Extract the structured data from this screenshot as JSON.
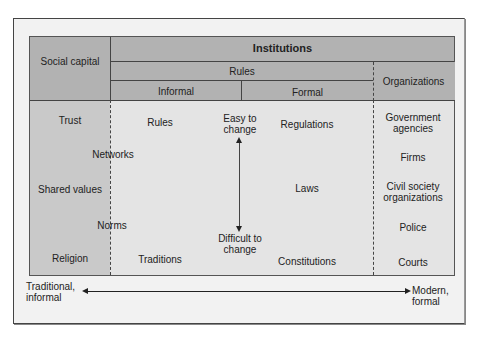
{
  "header": {
    "social_capital": "Social capital",
    "institutions": "Institutions",
    "rules": "Rules",
    "informal": "Informal",
    "formal": "Formal",
    "organizations": "Organizations"
  },
  "social_capital_items": [
    "Trust",
    "Networks",
    "Shared values",
    "Norms",
    "Religion"
  ],
  "informal_items": [
    "Rules",
    "Traditions"
  ],
  "change_axis": {
    "top": "Easy to change",
    "bottom": "Difficult to change"
  },
  "formal_items": [
    "Regulations",
    "Laws",
    "Constitutions"
  ],
  "organization_items": [
    "Government agencies",
    "Firms",
    "Civil society organizations",
    "Police",
    "Courts"
  ],
  "bottom_axis": {
    "left": "Traditional, informal",
    "right": "Modern, formal"
  },
  "colors": {
    "header": "#b2b2b2",
    "social_capital_col": "#c9c9c9",
    "body": "#e4e4e4"
  }
}
